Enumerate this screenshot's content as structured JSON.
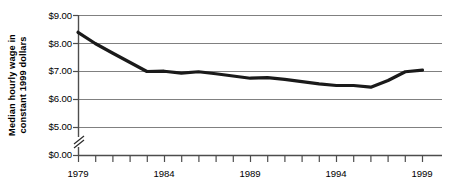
{
  "chart_data": {
    "type": "line",
    "title": "",
    "subtitle": "",
    "xlabel": "",
    "ylabel": "Median hourly wage in constant 1999 dollars",
    "ylabel_line1": "Median hourly wage in",
    "ylabel_line2": "constant 1999 dollars",
    "x": [
      1979,
      1980,
      1981,
      1982,
      1983,
      1984,
      1985,
      1986,
      1987,
      1988,
      1989,
      1990,
      1991,
      1992,
      1993,
      1994,
      1995,
      1996,
      1997,
      1998,
      1999
    ],
    "values": [
      8.4,
      8.0,
      7.66,
      7.33,
      7.0,
      7.01,
      6.94,
      6.99,
      6.92,
      6.84,
      6.76,
      6.78,
      6.72,
      6.64,
      6.56,
      6.5,
      6.5,
      6.44,
      6.68,
      6.99,
      7.05
    ],
    "series": [
      {
        "name": "Median hourly wage",
        "color": "#1a1a1a",
        "values": [
          8.4,
          8.0,
          7.66,
          7.33,
          7.0,
          7.01,
          6.94,
          6.99,
          6.92,
          6.84,
          6.76,
          6.78,
          6.72,
          6.64,
          6.56,
          6.5,
          6.5,
          6.44,
          6.68,
          6.99,
          7.05
        ]
      }
    ],
    "xlim": [
      1979,
      1999
    ],
    "ylim": [
      5.0,
      9.0
    ],
    "y_axis_break": true,
    "y_break_note": "axis broken between $0.00 and $5.00",
    "ytick_labels": [
      "$9.00",
      "$8.00",
      "$7.00",
      "$6.00",
      "$5.00",
      "$0.00"
    ],
    "ytick_values": [
      9.0,
      8.0,
      7.0,
      6.0,
      5.0,
      0.0
    ],
    "xtick_labels": [
      "1979",
      "1984",
      "1989",
      "1994",
      "1999"
    ],
    "xtick_values": [
      1979,
      1984,
      1989,
      1994,
      1999
    ],
    "x_minor_ticks_every": 1,
    "grid": "horizontal",
    "gridline_color": "#808080",
    "axis_color": "#4d4d4d",
    "legend": "none",
    "legend_position": "none",
    "annotations": []
  },
  "axis": {
    "break_symbol": "double-slash"
  }
}
